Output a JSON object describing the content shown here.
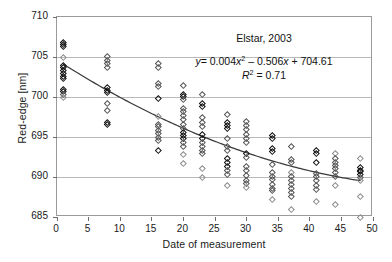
{
  "chart_data": {
    "type": "scatter",
    "title": "",
    "xlabel": "Date of measurement",
    "ylabel": "Red-edge [nm]",
    "xlim": [
      0,
      50
    ],
    "ylim": [
      685,
      710
    ],
    "xticks": [
      0,
      5,
      10,
      15,
      20,
      25,
      30,
      35,
      40,
      45,
      50
    ],
    "yticks": [
      685,
      690,
      695,
      700,
      705,
      710
    ],
    "grid": "horizontal",
    "legend": "none",
    "annotations": {
      "sample_label": "Elstar, 2003",
      "equation_y": "y",
      "equation_eq": "=",
      "equation_body": "0.004x",
      "equation_exp": "2",
      "equation_rest": "– 0.506x + 704.61",
      "equation_plain": "y = 0.004x² – 0.506x + 704.61",
      "r2_symbol": "R",
      "r2_exp": "2",
      "r2_value": "= 0.71",
      "r2_plain": "R² = 0.71"
    },
    "fit": {
      "kind": "quadratic",
      "a": 0.004,
      "b": -0.506,
      "c": 704.61,
      "r2": 0.71,
      "color": "#3a3a3a",
      "x_start": 1,
      "x_end": 48
    },
    "marker": {
      "shape": "open-diamond",
      "color": "#555555",
      "size_px": 4.6
    },
    "series": [
      {
        "name": "Red-edge measurements",
        "points": [
          [
            1,
            706.8,
            "dark"
          ],
          [
            1,
            706.6,
            "dark"
          ],
          [
            1,
            706.4,
            "dark"
          ],
          [
            1,
            705.0,
            "faint"
          ],
          [
            1,
            704.0,
            "dark"
          ],
          [
            1,
            703.7,
            "dark"
          ],
          [
            1,
            703.3,
            "dark"
          ],
          [
            1,
            703.0,
            "dark"
          ],
          [
            1,
            702.6,
            "dark"
          ],
          [
            1,
            702.3,
            "dark"
          ],
          [
            1,
            701.0,
            "dark"
          ],
          [
            1,
            700.7,
            "dark"
          ],
          [
            1,
            700.4,
            "normal"
          ],
          [
            1,
            700.0,
            "faint"
          ],
          [
            8,
            705.1,
            "normal"
          ],
          [
            8,
            704.6,
            "normal"
          ],
          [
            8,
            704.2,
            "normal"
          ],
          [
            8,
            703.7,
            "normal"
          ],
          [
            8,
            701.2,
            "dark"
          ],
          [
            8,
            700.9,
            "dark"
          ],
          [
            8,
            700.6,
            "dark"
          ],
          [
            8,
            699.2,
            "normal"
          ],
          [
            8,
            698.4,
            "normal"
          ],
          [
            8,
            696.9,
            "dark"
          ],
          [
            8,
            696.6,
            "dark"
          ],
          [
            16,
            704.2,
            "normal"
          ],
          [
            16,
            703.7,
            "normal"
          ],
          [
            16,
            701.7,
            "normal"
          ],
          [
            16,
            701.4,
            "normal"
          ],
          [
            16,
            699.8,
            "dark"
          ],
          [
            16,
            697.6,
            "faint"
          ],
          [
            16,
            696.6,
            "normal"
          ],
          [
            16,
            696.3,
            "normal"
          ],
          [
            16,
            695.9,
            "normal"
          ],
          [
            16,
            695.5,
            "normal"
          ],
          [
            16,
            695.0,
            "normal"
          ],
          [
            16,
            694.6,
            "normal"
          ],
          [
            16,
            693.3,
            "dark"
          ],
          [
            20,
            701.5,
            "normal"
          ],
          [
            20,
            700.4,
            "dark"
          ],
          [
            20,
            700.1,
            "dark"
          ],
          [
            20,
            699.7,
            "normal"
          ],
          [
            20,
            698.6,
            "normal"
          ],
          [
            20,
            698.2,
            "normal"
          ],
          [
            20,
            697.7,
            "normal"
          ],
          [
            20,
            697.2,
            "normal"
          ],
          [
            20,
            696.6,
            "normal"
          ],
          [
            20,
            696.1,
            "normal"
          ],
          [
            20,
            695.6,
            "dark"
          ],
          [
            20,
            695.2,
            "dark"
          ],
          [
            20,
            694.8,
            "dark"
          ],
          [
            20,
            694.4,
            "normal"
          ],
          [
            20,
            693.9,
            "normal"
          ],
          [
            20,
            692.8,
            "faint"
          ],
          [
            20,
            691.7,
            "faint"
          ],
          [
            23,
            700.3,
            "normal"
          ],
          [
            23,
            699.2,
            "dark"
          ],
          [
            23,
            698.9,
            "dark"
          ],
          [
            23,
            697.5,
            "normal"
          ],
          [
            23,
            696.9,
            "normal"
          ],
          [
            23,
            696.3,
            "normal"
          ],
          [
            23,
            695.4,
            "dark"
          ],
          [
            23,
            694.9,
            "dark"
          ],
          [
            23,
            694.4,
            "normal"
          ],
          [
            23,
            693.9,
            "normal"
          ],
          [
            23,
            693.4,
            "normal"
          ],
          [
            23,
            693.0,
            "normal"
          ],
          [
            23,
            691.1,
            "faint"
          ],
          [
            23,
            690.0,
            "faint"
          ],
          [
            27,
            697.9,
            "normal"
          ],
          [
            27,
            696.9,
            "dark"
          ],
          [
            27,
            696.5,
            "dark"
          ],
          [
            27,
            696.1,
            "dark"
          ],
          [
            27,
            694.9,
            "normal"
          ],
          [
            27,
            693.9,
            "normal"
          ],
          [
            27,
            693.4,
            "normal"
          ],
          [
            27,
            692.3,
            "dark"
          ],
          [
            27,
            691.9,
            "dark"
          ],
          [
            27,
            691.4,
            "dark"
          ],
          [
            27,
            690.9,
            "normal"
          ],
          [
            27,
            690.4,
            "normal"
          ],
          [
            27,
            689.0,
            "faint"
          ],
          [
            30,
            697.0,
            "normal"
          ],
          [
            30,
            696.5,
            "normal"
          ],
          [
            30,
            696.0,
            "normal"
          ],
          [
            30,
            695.4,
            "normal"
          ],
          [
            30,
            694.9,
            "normal"
          ],
          [
            30,
            694.4,
            "normal"
          ],
          [
            30,
            693.0,
            "dark"
          ],
          [
            30,
            692.5,
            "normal"
          ],
          [
            30,
            691.3,
            "normal"
          ],
          [
            30,
            690.9,
            "normal"
          ],
          [
            30,
            690.2,
            "normal"
          ],
          [
            30,
            689.6,
            "normal"
          ],
          [
            30,
            689.2,
            "normal"
          ],
          [
            30,
            688.7,
            "faint"
          ],
          [
            34,
            695.2,
            "dark"
          ],
          [
            34,
            694.9,
            "dark"
          ],
          [
            34,
            693.6,
            "dark"
          ],
          [
            34,
            693.2,
            "dark"
          ],
          [
            34,
            691.6,
            "normal"
          ],
          [
            34,
            690.6,
            "normal"
          ],
          [
            34,
            690.1,
            "normal"
          ],
          [
            34,
            689.7,
            "normal"
          ],
          [
            34,
            689.1,
            "normal"
          ],
          [
            34,
            688.6,
            "normal"
          ],
          [
            34,
            688.3,
            "normal"
          ],
          [
            34,
            687.2,
            "faint"
          ],
          [
            37,
            693.9,
            "normal"
          ],
          [
            37,
            692.2,
            "normal"
          ],
          [
            37,
            691.8,
            "normal"
          ],
          [
            37,
            690.6,
            "faint"
          ],
          [
            37,
            690.1,
            "normal"
          ],
          [
            37,
            689.6,
            "normal"
          ],
          [
            37,
            689.1,
            "normal"
          ],
          [
            37,
            688.6,
            "normal"
          ],
          [
            37,
            688.1,
            "normal"
          ],
          [
            37,
            687.6,
            "normal"
          ],
          [
            37,
            686.0,
            "faint"
          ],
          [
            41,
            693.3,
            "dark"
          ],
          [
            41,
            693.0,
            "dark"
          ],
          [
            41,
            691.8,
            "dark"
          ],
          [
            41,
            690.5,
            "normal"
          ],
          [
            41,
            690.1,
            "normal"
          ],
          [
            41,
            689.6,
            "normal"
          ],
          [
            41,
            689.0,
            "normal"
          ],
          [
            41,
            688.5,
            "normal"
          ],
          [
            41,
            687.0,
            "faint"
          ],
          [
            44,
            693.0,
            "faint"
          ],
          [
            44,
            692.3,
            "normal"
          ],
          [
            44,
            691.9,
            "normal"
          ],
          [
            44,
            691.5,
            "normal"
          ],
          [
            44,
            691.1,
            "normal"
          ],
          [
            44,
            690.6,
            "normal"
          ],
          [
            44,
            690.1,
            "normal"
          ],
          [
            44,
            689.0,
            "faint"
          ],
          [
            44,
            686.6,
            "faint"
          ],
          [
            48,
            692.4,
            "faint"
          ],
          [
            48,
            691.2,
            "dark"
          ],
          [
            48,
            690.9,
            "dark"
          ],
          [
            48,
            690.7,
            "dark"
          ],
          [
            48,
            690.4,
            "dark"
          ],
          [
            48,
            690.0,
            "normal"
          ],
          [
            48,
            689.6,
            "faint"
          ],
          [
            48,
            687.6,
            "faint"
          ],
          [
            48,
            685.0,
            "faint"
          ]
        ]
      }
    ]
  }
}
